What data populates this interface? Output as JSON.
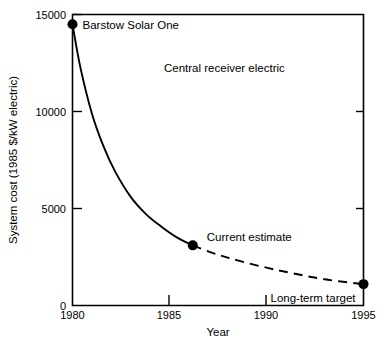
{
  "chart_data": {
    "type": "line",
    "title": "",
    "xlabel": "Year",
    "ylabel": "System cost (1985 $/kW electric)",
    "xlim": [
      1980,
      1995
    ],
    "ylim": [
      0,
      15000
    ],
    "xticks": [
      "1980",
      "1985",
      "1990",
      "1995"
    ],
    "xtick_values": [
      1980,
      1985,
      1990,
      1995
    ],
    "yticks": [
      "0",
      "5000",
      "10000",
      "15000"
    ],
    "ytick_values": [
      0,
      5000,
      10000,
      15000
    ],
    "grid": false,
    "legend": "none",
    "series": [
      {
        "name": "Central receiver electric",
        "style": "solid",
        "segment": "historical",
        "x": [
          1980,
          1980.4,
          1981,
          1981.6,
          1982.2,
          1983,
          1983.8,
          1984.6,
          1985.4,
          1986.2
        ],
        "values": [
          14500,
          12300,
          9900,
          8200,
          6900,
          5600,
          4700,
          4050,
          3500,
          3100
        ]
      },
      {
        "name": "Central receiver electric (projected)",
        "style": "dashed",
        "segment": "projected",
        "x": [
          1986.2,
          1987.4,
          1988.6,
          1990,
          1991.4,
          1993,
          1995
        ],
        "values": [
          3100,
          2650,
          2300,
          1950,
          1650,
          1350,
          1100
        ]
      }
    ],
    "points": [
      {
        "label": "Barstow Solar One",
        "x": 1980,
        "y": 14500,
        "label_dx": 10,
        "label_dy": 5
      },
      {
        "label": "Current estimate",
        "x": 1986.2,
        "y": 3100,
        "label_dx": 14,
        "label_dy": -4
      },
      {
        "label": "Long-term target",
        "x": 1995,
        "y": 1100,
        "label_dx": -8,
        "label_dy": 18
      }
    ],
    "annotations": [
      {
        "label": "Central receiver electric",
        "x": 1986.2,
        "y": 12300
      }
    ],
    "colors": {
      "axis": "#000000",
      "series": "#000000",
      "background": "#ffffff"
    }
  }
}
